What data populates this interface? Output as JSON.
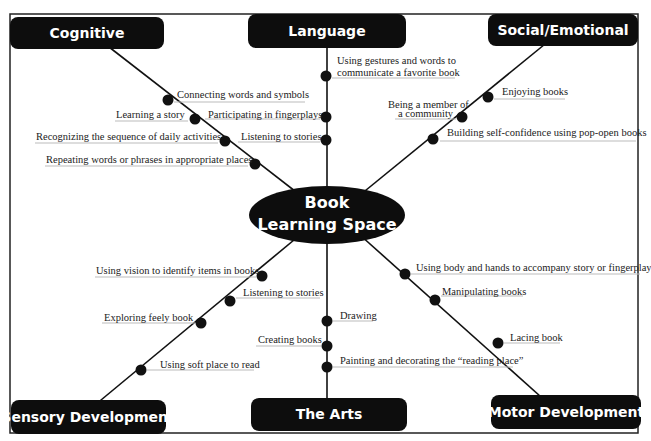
{
  "hub": {
    "line1": "Book",
    "line2": "Learning Space"
  },
  "categories": {
    "cognitive": "Cognitive",
    "language": "Language",
    "social": "Social/Emotional",
    "sensory": "Sensory Development",
    "arts": "The Arts",
    "motor": "Motor Development"
  },
  "cognitive_items": [
    "Connecting words and symbols",
    "Learning a story",
    "Recognizing the sequence of daily activities",
    "Repeating words or phrases in appropriate places"
  ],
  "language_items": [
    "Using gestures and words to",
    "communicate a favorite book",
    "Participating in fingerplays",
    "Listening to stories"
  ],
  "social_items": [
    "Enjoying books",
    "Being a member of",
    "a community",
    "Building self-confidence using pop-open books"
  ],
  "sensory_items": [
    "Using vision to identify items in books",
    "Listening to stories",
    "Exploring feely book",
    "Using soft place to read"
  ],
  "arts_items": [
    "Drawing",
    "Creating books",
    "Painting and decorating the “reading place”"
  ],
  "motor_items": [
    "Using body and hands to accompany story or fingerplay",
    "Manipulating books",
    "Lacing book"
  ],
  "colors": {
    "box": "#0d0d0d",
    "text": "#222222",
    "background": "#ffffff"
  }
}
